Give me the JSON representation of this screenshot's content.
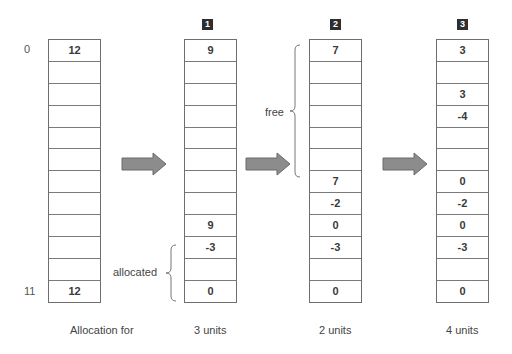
{
  "diagram": {
    "colors": {
      "cell_border": "#6e6e6e",
      "arrow_fill": "#8c8c8c",
      "arrow_stroke": "#6a6a6a",
      "badge_bg": "#2e2e2e",
      "text": "#333333"
    },
    "index_labels": {
      "first": "0",
      "last": "11"
    },
    "columns": [
      {
        "badge": "",
        "caption": "Allocation for",
        "cells": [
          "12",
          "",
          "",
          "",
          "",
          "",
          "",
          "",
          "",
          "",
          "",
          "12"
        ]
      },
      {
        "badge": "1",
        "caption": "3 units",
        "cells": [
          "9",
          "",
          "",
          "",
          "",
          "",
          "",
          "",
          "9",
          "-3",
          "",
          "0"
        ]
      },
      {
        "badge": "2",
        "caption": "2 units",
        "cells": [
          "7",
          "",
          "",
          "",
          "",
          "",
          "7",
          "-2",
          "0",
          "-3",
          "",
          "0"
        ]
      },
      {
        "badge": "3",
        "caption": "4 units",
        "cells": [
          "3",
          "",
          "3",
          "-4",
          "",
          "",
          "0",
          "-2",
          "0",
          "-3",
          "",
          "0"
        ]
      }
    ],
    "annotations": {
      "free_label": "free",
      "allocated_label": "allocated"
    },
    "arrows": [
      {
        "name": "step-1-arrow",
        "icon": "right-arrow-icon"
      },
      {
        "name": "step-2-arrow",
        "icon": "right-arrow-icon"
      },
      {
        "name": "step-3-arrow",
        "icon": "right-arrow-icon"
      }
    ]
  }
}
